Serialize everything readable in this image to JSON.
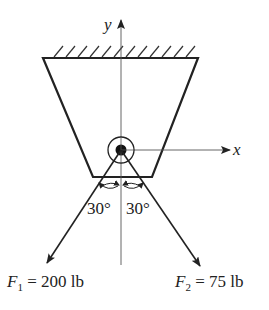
{
  "diagram": {
    "axes": {
      "x_label": "x",
      "y_label": "y"
    },
    "support": "fixed ceiling (hatched)",
    "body": "trapezoidal bracket with pin at origin",
    "angles": {
      "left": "30°",
      "right": "30°"
    },
    "forces": [
      {
        "symbol": "F",
        "subscript": "1",
        "equals": " = 200 lb",
        "magnitude": 200,
        "unit": "lb",
        "angle_from_vertical_deg": 30,
        "direction": "down-left"
      },
      {
        "symbol": "F",
        "subscript": "2",
        "equals": " = 75 lb",
        "magnitude": 75,
        "unit": "lb",
        "angle_from_vertical_deg": 30,
        "direction": "down-right"
      }
    ],
    "colors": {
      "line": "#222222",
      "background": "#ffffff"
    }
  }
}
